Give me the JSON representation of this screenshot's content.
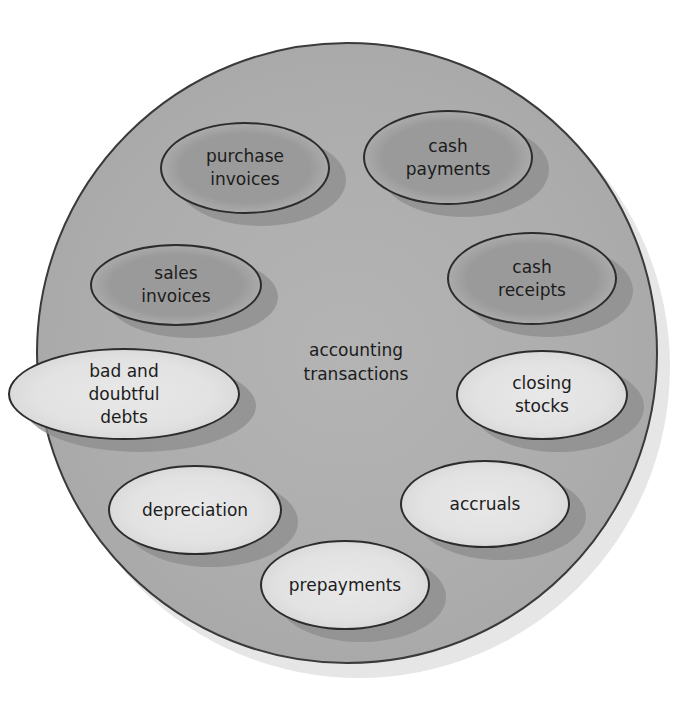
{
  "diagram": {
    "title": "",
    "center": {
      "label": "accounting\ntransactions"
    },
    "nodes": [
      {
        "id": "purchase-invoices",
        "label": "purchase\ninvoices",
        "style": "dark"
      },
      {
        "id": "cash-payments",
        "label": "cash\npayments",
        "style": "dark"
      },
      {
        "id": "sales-invoices",
        "label": "sales\ninvoices",
        "style": "dark"
      },
      {
        "id": "cash-receipts",
        "label": "cash\nreceipts",
        "style": "dark"
      },
      {
        "id": "bad-and-doubtful-debts",
        "label": "bad and\ndoubtful\ndebts",
        "style": "light"
      },
      {
        "id": "closing-stocks",
        "label": "closing\nstocks",
        "style": "light"
      },
      {
        "id": "depreciation",
        "label": "depreciation",
        "style": "light"
      },
      {
        "id": "accruals",
        "label": "accruals",
        "style": "light"
      },
      {
        "id": "prepayments",
        "label": "prepayments",
        "style": "light"
      }
    ],
    "colors": {
      "outline": "#2c2c2c",
      "circle_fill": "#acacac",
      "dark_node_fill": "#9a9a9a",
      "light_node_fill": "#e4e4e4",
      "shadow": "#8c8c8c"
    }
  }
}
